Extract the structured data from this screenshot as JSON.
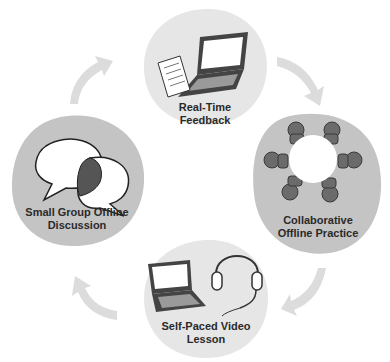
{
  "diagram": {
    "type": "cycle",
    "stages": [
      {
        "id": "real-time-feedback",
        "label_line1": "Real-Time",
        "label_line2": "Feedback",
        "icon": "laptop-with-document-icon",
        "fill": "#e6e6e6"
      },
      {
        "id": "collaborative-offline-practice",
        "label_line1": "Collaborative",
        "label_line2": "Offline Practice",
        "icon": "round-table-people-icon",
        "fill": "#c4c4c4"
      },
      {
        "id": "self-paced-video-lesson",
        "label_line1": "Self-Paced Video",
        "label_line2": "Lesson",
        "icon": "laptop-headset-icon",
        "fill": "#e6e6e6"
      },
      {
        "id": "small-group-offline-discussion",
        "label_line1": "Small Group Offline",
        "label_line2": "Discussion",
        "icon": "speech-bubbles-icon",
        "fill": "#c4c4c4"
      }
    ],
    "arrow_color": "#dcdcdc",
    "direction": "clockwise"
  }
}
